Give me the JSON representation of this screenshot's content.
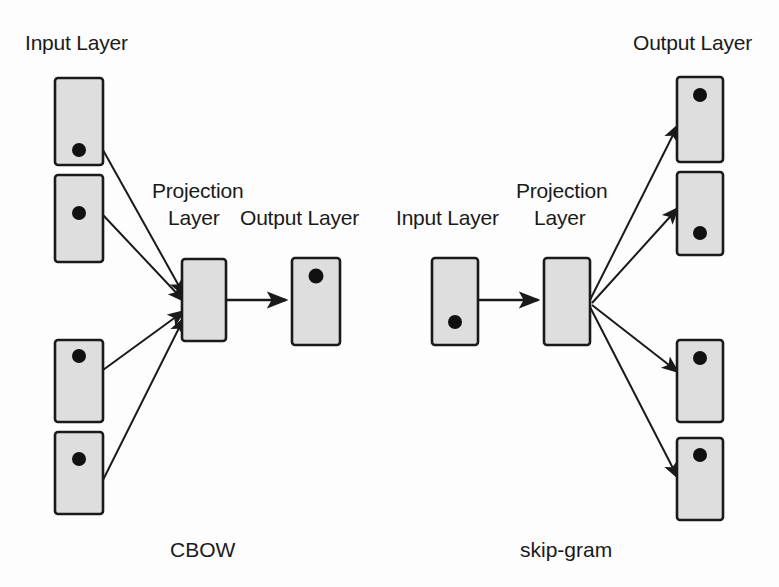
{
  "figure": {
    "background_color": "#fdfdfd",
    "box_fill": "#dedede",
    "box_stroke": "#1a1a1a",
    "node_dot_color": "#111111",
    "arrow_color": "#1a1a1a"
  },
  "labels": {
    "cbow_input_layer": "Input Layer",
    "cbow_projection_line1": "Projection",
    "cbow_projection_line2": "Layer",
    "cbow_output_layer": "Output Layer",
    "skipgram_input_layer": "Input Layer",
    "skipgram_projection_line1": "Projection",
    "skipgram_projection_line2": "Layer",
    "skipgram_output_layer": "Output Layer"
  },
  "captions": {
    "left_model": "CBOW",
    "right_model": "skip-gram"
  },
  "cbow": {
    "input_boxes": [
      {
        "x": 55,
        "y": 78,
        "w": 48,
        "h": 87,
        "dot_cx": 79,
        "dot_cy": 150
      },
      {
        "x": 55,
        "y": 175,
        "w": 48,
        "h": 87,
        "dot_cx": 79,
        "dot_cy": 213
      },
      {
        "x": 55,
        "y": 340,
        "w": 48,
        "h": 82,
        "dot_cx": 79,
        "dot_cy": 356
      },
      {
        "x": 55,
        "y": 432,
        "w": 48,
        "h": 82,
        "dot_cx": 79,
        "dot_cy": 459
      }
    ],
    "projection_box": {
      "x": 182,
      "y": 259,
      "w": 44,
      "h": 82
    },
    "output_box": {
      "x": 292,
      "y": 258,
      "w": 48,
      "h": 87,
      "dot_cx": 316,
      "dot_cy": 275
    },
    "converge_point": {
      "x": 182,
      "y": 300
    },
    "output_arrow": {
      "x1": 226,
      "y1": 300,
      "x2": 290,
      "y2": 300
    }
  },
  "skipgram": {
    "input_box": {
      "x": 432,
      "y": 258,
      "w": 46,
      "h": 87,
      "dot_cx": 455,
      "dot_cy": 322
    },
    "projection_box": {
      "x": 544,
      "y": 258,
      "w": 46,
      "h": 87
    },
    "input_arrow": {
      "x1": 479,
      "y1": 300,
      "x2": 542,
      "y2": 300
    },
    "fan_point": {
      "x": 590,
      "y": 300
    },
    "output_boxes": [
      {
        "x": 677,
        "y": 77,
        "w": 46,
        "h": 85,
        "dot_cx": 700,
        "dot_cy": 95
      },
      {
        "x": 677,
        "y": 172,
        "w": 46,
        "h": 83,
        "dot_cx": 700,
        "dot_cy": 233
      },
      {
        "x": 677,
        "y": 340,
        "w": 46,
        "h": 82,
        "dot_cx": 700,
        "dot_cy": 358
      },
      {
        "x": 677,
        "y": 438,
        "w": 46,
        "h": 82,
        "dot_cx": 700,
        "dot_cy": 455
      }
    ]
  }
}
